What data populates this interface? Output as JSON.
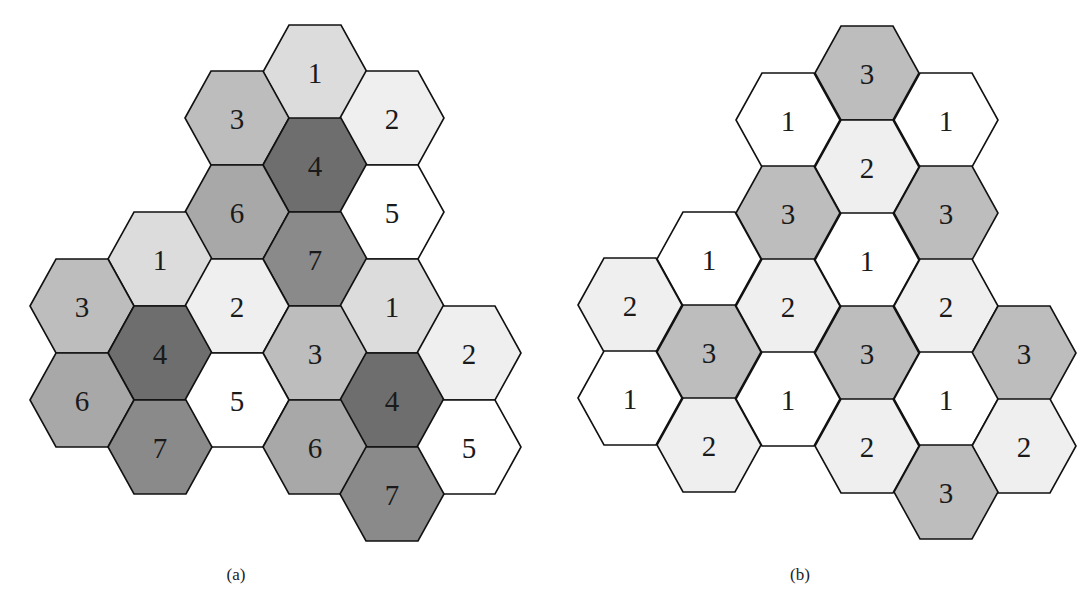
{
  "figure": {
    "hex": {
      "radius": 52,
      "half_height": 47,
      "orientation": "flat-top"
    },
    "panels": [
      {
        "id": "a",
        "caption": "(a)",
        "caption_x": 236,
        "reuse_factor": 7,
        "colors": {
          "1": "#dcdcdc",
          "2": "#efefef",
          "3": "#bdbdbd",
          "4": "#6e6e6e",
          "5": "#ffffff",
          "6": "#a8a8a8",
          "7": "#8a8a8a"
        },
        "cells": [
          {
            "label": "1",
            "x": 315,
            "y": 72
          },
          {
            "label": "3",
            "x": 237,
            "y": 118
          },
          {
            "label": "2",
            "x": 392,
            "y": 118
          },
          {
            "label": "4",
            "x": 315,
            "y": 165
          },
          {
            "label": "6",
            "x": 237,
            "y": 212
          },
          {
            "label": "5",
            "x": 392,
            "y": 212
          },
          {
            "label": "1",
            "x": 160,
            "y": 259
          },
          {
            "label": "7",
            "x": 315,
            "y": 259
          },
          {
            "label": "3",
            "x": 82,
            "y": 306
          },
          {
            "label": "2",
            "x": 237,
            "y": 306
          },
          {
            "label": "1",
            "x": 392,
            "y": 306
          },
          {
            "label": "4",
            "x": 160,
            "y": 353
          },
          {
            "label": "3",
            "x": 315,
            "y": 353
          },
          {
            "label": "2",
            "x": 469,
            "y": 353
          },
          {
            "label": "6",
            "x": 82,
            "y": 400
          },
          {
            "label": "5",
            "x": 237,
            "y": 400
          },
          {
            "label": "4",
            "x": 392,
            "y": 400
          },
          {
            "label": "7",
            "x": 160,
            "y": 447
          },
          {
            "label": "6",
            "x": 315,
            "y": 447
          },
          {
            "label": "5",
            "x": 469,
            "y": 447
          },
          {
            "label": "7",
            "x": 392,
            "y": 494
          }
        ]
      },
      {
        "id": "b",
        "caption": "(b)",
        "caption_x": 800,
        "reuse_factor": 3,
        "colors": {
          "1": "#ffffff",
          "2": "#efefef",
          "3": "#bdbdbd"
        },
        "cells": [
          {
            "label": "3",
            "x": 867,
            "y": 73
          },
          {
            "label": "1",
            "x": 788,
            "y": 120
          },
          {
            "label": "1",
            "x": 946,
            "y": 120
          },
          {
            "label": "2",
            "x": 867,
            "y": 167
          },
          {
            "label": "3",
            "x": 788,
            "y": 213
          },
          {
            "label": "3",
            "x": 946,
            "y": 213
          },
          {
            "label": "1",
            "x": 709,
            "y": 259
          },
          {
            "label": "1",
            "x": 867,
            "y": 260
          },
          {
            "label": "2",
            "x": 630,
            "y": 305
          },
          {
            "label": "2",
            "x": 788,
            "y": 306
          },
          {
            "label": "2",
            "x": 946,
            "y": 306
          },
          {
            "label": "3",
            "x": 709,
            "y": 352
          },
          {
            "label": "3",
            "x": 867,
            "y": 353
          },
          {
            "label": "3",
            "x": 1024,
            "y": 353
          },
          {
            "label": "1",
            "x": 630,
            "y": 398
          },
          {
            "label": "1",
            "x": 788,
            "y": 399
          },
          {
            "label": "1",
            "x": 946,
            "y": 399
          },
          {
            "label": "2",
            "x": 709,
            "y": 445
          },
          {
            "label": "2",
            "x": 867,
            "y": 446
          },
          {
            "label": "2",
            "x": 1024,
            "y": 446
          },
          {
            "label": "3",
            "x": 946,
            "y": 492
          }
        ]
      }
    ]
  }
}
